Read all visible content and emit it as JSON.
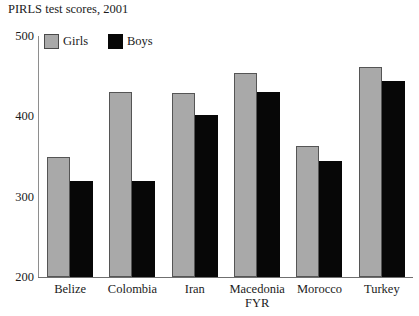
{
  "chart_data": {
    "type": "bar",
    "title": "PIRLS test scores, 2001",
    "xlabel": "",
    "ylabel": "",
    "ylim": [
      200,
      500
    ],
    "yticks": [
      200,
      300,
      400,
      500
    ],
    "grid": false,
    "legend_position": "top-left",
    "categories": [
      "Belize",
      "Colombia",
      "Iran",
      "Macedonia FYR",
      "Morocco",
      "Turkey"
    ],
    "category_lines": [
      [
        "Belize"
      ],
      [
        "Colombia"
      ],
      [
        "Iran"
      ],
      [
        "Macedonia",
        "FYR"
      ],
      [
        "Morocco"
      ],
      [
        "Turkey"
      ]
    ],
    "series": [
      {
        "name": "Girls",
        "color": "#a9a9a9",
        "values": [
          350,
          430,
          429,
          454,
          363,
          461
        ]
      },
      {
        "name": "Boys",
        "color": "#070707",
        "values": [
          319,
          319,
          402,
          430,
          345,
          444
        ]
      }
    ]
  }
}
